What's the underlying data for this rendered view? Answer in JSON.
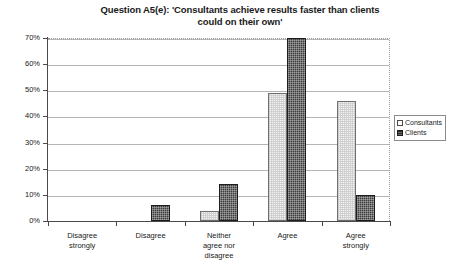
{
  "chart_data": {
    "type": "bar",
    "title": "Question A5(e): 'Consultants achieve results faster than clients could on their own'",
    "title_line1": "Question A5(e): 'Consultants achieve results faster than clients",
    "title_line2": "could on their own'",
    "xlabel": "",
    "ylabel": "",
    "ylim": [
      0,
      70
    ],
    "ytick_values": [
      0,
      10,
      20,
      30,
      40,
      50,
      60,
      70
    ],
    "ytick_labels": [
      "0%",
      "10%",
      "20%",
      "30%",
      "40%",
      "50%",
      "60%",
      "70%"
    ],
    "grid": true,
    "legend_position": "right",
    "categories": [
      "Disagree strongly",
      "Disagree",
      "Neither agree nor disagree",
      "Agree",
      "Agree strongly"
    ],
    "category_lines": [
      [
        "Disagree",
        "strongly"
      ],
      [
        "Disagree"
      ],
      [
        "Neither",
        "agree nor",
        "disagree"
      ],
      [
        "Agree"
      ],
      [
        "Agree",
        "strongly"
      ]
    ],
    "series": [
      {
        "name": "Consultants",
        "color": "#f4f4f4",
        "values": [
          0,
          0,
          4,
          49,
          46
        ]
      },
      {
        "name": "Clients",
        "color": "#3b3b3b",
        "values": [
          0,
          6,
          14,
          70,
          10
        ]
      }
    ]
  },
  "legend": {
    "items": [
      {
        "label": "Consultants"
      },
      {
        "label": "Clients"
      }
    ]
  }
}
